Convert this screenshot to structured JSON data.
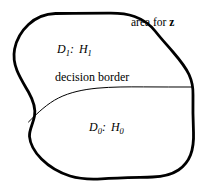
{
  "figure": {
    "background_color": "#ffffff",
    "stroke_color": "#000000",
    "outline_stroke_width": 2.8,
    "border_stroke_width": 1.0,
    "width": 201,
    "height": 187
  },
  "labels": {
    "area_for_z": {
      "prefix": "area for ",
      "variable": "z"
    },
    "region_upper": {
      "decision": "D",
      "decision_sub": "1",
      "separator": ":",
      "hypothesis": "H",
      "hypothesis_sub": "1",
      "full_text": "D1: H1"
    },
    "decision_border": {
      "text": "decision border"
    },
    "region_lower": {
      "decision": "D",
      "decision_sub": "0",
      "separator": ":",
      "hypothesis": "H",
      "hypothesis_sub": "0",
      "full_text": "D0: H0"
    }
  },
  "geometry": {
    "outline_path": "M 55.5 13.5 C 45 13.8 36 17.5 28.5 24.5 C 21.5 31 16.5 39.5 14.6 49 C 13.2 56.5 14.2 63.5 17 70.5 C 20 78 24.5 85 28.5 92 C 33 100 36 108 34.5 116 C 33 124 29 130 29.5 136.5 C 30.2 145 35 152.5 41.5 159 C 49 166.5 59 172.5 70 176 C 80 179 91 179.5 101.5 178.8 C 118 177.8 136 177.5 152.5 177 C 162 176.7 171 175 178.5 170 C 184 166.2 188.2 161 190.5 155 C 193.2 148 193.8 140 193.5 132 C 193 120 192.8 107 193 95 C 193.2 88 192 81 189 74.5 C 185 66 179 59 173 52 C 167 45 161 38.5 155.5 31.5 C 150 24.5 143 19.5 134.5 16.5 C 126 13.5 117 13 108 13.2 C 90.5 13.4 73 13.4 55.5 13.5 Z",
    "decision_border_path": "M 28.5 122 C 38 112.5 47.5 103.5 58.5 98 C 70 92.2 83.5 89.5 97 88.2 C 112 86.8 128 86.8 143.5 86.9 C 160 87 176.5 87 193 87",
    "outline_description": "irregular hand-drawn closed blob spanning nearly the full canvas",
    "border_description": "thin curve rising from left blob edge then running flat to right blob edge"
  }
}
